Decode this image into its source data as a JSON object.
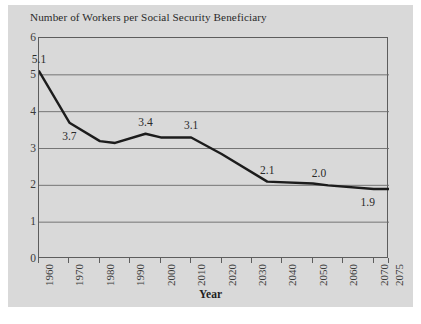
{
  "chart_data": {
    "type": "line",
    "title": "Number of Workers per Social Security Beneficiary",
    "xlabel": "Year",
    "ylabel": "",
    "xlim": [
      1960,
      2075
    ],
    "ylim": [
      0,
      6
    ],
    "grid": true,
    "legend": null,
    "y_ticks": [
      0,
      1,
      2,
      3,
      4,
      5,
      6
    ],
    "y_tick_labels": [
      "0",
      "1",
      "2",
      "3",
      "4",
      "5",
      "6"
    ],
    "x_ticks": [
      1960,
      1970,
      1980,
      1990,
      2000,
      2010,
      2020,
      2030,
      2040,
      2050,
      2060,
      2070,
      2075
    ],
    "x_tick_labels": [
      "1960",
      "1970",
      "1980",
      "1990",
      "2000",
      "2010",
      "2020",
      "2030",
      "2040",
      "2050",
      "2060",
      "2070",
      "2075"
    ],
    "series": [
      {
        "name": "Workers per beneficiary",
        "color": "#1c1c1c",
        "x": [
          1960,
          1970,
          1980,
          1985,
          1995,
          2000,
          2010,
          2020,
          2035,
          2050,
          2055,
          2070,
          2075
        ],
        "y": [
          5.1,
          3.7,
          3.2,
          3.15,
          3.4,
          3.3,
          3.3,
          2.85,
          2.1,
          2.05,
          2.0,
          1.9,
          1.9
        ]
      }
    ],
    "annotations": [
      {
        "label": "5.1",
        "x": 1960,
        "y": 5.1,
        "position": "above"
      },
      {
        "label": "3.7",
        "x": 1970,
        "y": 3.7,
        "position": "below"
      },
      {
        "label": "3.4",
        "x": 1995,
        "y": 3.4,
        "position": "above"
      },
      {
        "label": "3.1",
        "x": 2010,
        "y": 3.3,
        "position": "above"
      },
      {
        "label": "2.1",
        "x": 2035,
        "y": 2.1,
        "position": "above"
      },
      {
        "label": "2.0",
        "x": 2052,
        "y": 2.0,
        "position": "above"
      },
      {
        "label": "1.9",
        "x": 2068,
        "y": 1.9,
        "position": "below"
      }
    ]
  },
  "colors": {
    "figure_background": "#d9d9d9",
    "page_background": "#ffffff",
    "line": "#1c1c1c",
    "grid": "#6a6a6a",
    "frame": "#5d5d5d",
    "text": "#2a2a2a"
  }
}
